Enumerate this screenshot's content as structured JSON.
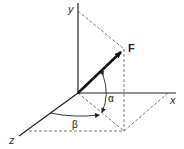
{
  "diagram": {
    "type": "3d-force-vector-angles",
    "axes": {
      "x_label": "x",
      "y_label": "y",
      "z_label": "z"
    },
    "vector": {
      "label": "F"
    },
    "angles": {
      "alpha": "α",
      "beta": "β"
    },
    "colors": {
      "axis": "#222222",
      "vector": "#111111",
      "dashed": "#555555",
      "background": "#ffffff"
    }
  }
}
